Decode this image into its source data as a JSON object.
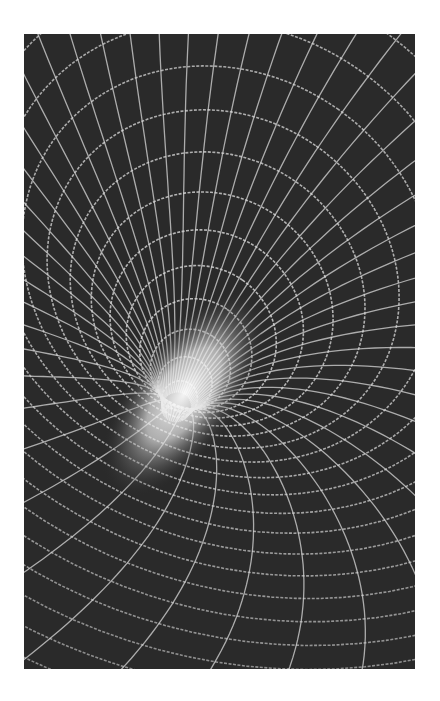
{
  "image": {
    "subject": "wireframe-funnel-gravity-well",
    "palette": {
      "background": "#2a2a2a",
      "grid_line": "#d8d8d8",
      "throat_glow": "#f4f4f4",
      "page": "#ffffff"
    },
    "frame": {
      "x": 24,
      "y": 34,
      "width": 391,
      "height": 635
    },
    "throat": {
      "cx": 175,
      "cy": 410,
      "rx": 40,
      "ry": 95,
      "rotate": 35
    },
    "rings": 22,
    "spokes": 48
  }
}
